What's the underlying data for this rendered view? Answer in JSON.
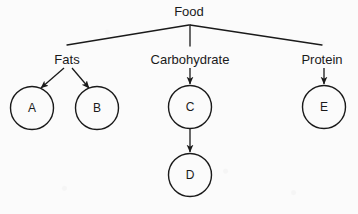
{
  "diagram": {
    "type": "tree-flowchart",
    "title_node": {
      "id": "food",
      "label": "Food",
      "x": 189,
      "y": 16
    },
    "category_nodes": [
      {
        "id": "fats",
        "label": "Fats",
        "x": 67,
        "y": 60
      },
      {
        "id": "carbohydrate",
        "label": "Carbohydrate",
        "x": 190,
        "y": 60
      },
      {
        "id": "protein",
        "label": "Protein",
        "x": 322,
        "y": 60
      }
    ],
    "circle_nodes": [
      {
        "id": "a",
        "label": "A",
        "cx": 32,
        "cy": 108,
        "r": 21.5
      },
      {
        "id": "b",
        "label": "B",
        "cx": 97,
        "cy": 108,
        "r": 21.5
      },
      {
        "id": "c",
        "label": "C",
        "cx": 190,
        "cy": 107,
        "r": 21.5
      },
      {
        "id": "d",
        "label": "D",
        "cx": 190,
        "cy": 175,
        "r": 21.5
      },
      {
        "id": "e",
        "label": "E",
        "cx": 324,
        "cy": 107,
        "r": 21.5
      }
    ],
    "edges": [
      {
        "from": "food",
        "to": "fats",
        "arrow": false
      },
      {
        "from": "food",
        "to": "carbohydrate",
        "arrow": false
      },
      {
        "from": "food",
        "to": "protein",
        "arrow": false
      },
      {
        "from": "fats",
        "to": "a",
        "arrow": true
      },
      {
        "from": "fats",
        "to": "b",
        "arrow": true
      },
      {
        "from": "carbohydrate",
        "to": "c",
        "arrow": true
      },
      {
        "from": "c",
        "to": "d",
        "arrow": true
      },
      {
        "from": "protein",
        "to": "e",
        "arrow": true
      }
    ],
    "colors": {
      "background": "#fbfbfb",
      "stroke": "#1a1a1a",
      "text": "#1a1a1a"
    }
  }
}
